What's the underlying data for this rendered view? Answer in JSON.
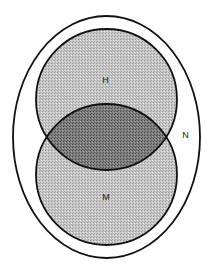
{
  "diagram": {
    "type": "venn",
    "sets": [
      {
        "id": "N",
        "label": "N",
        "shape": "ellipse",
        "role": "universe"
      },
      {
        "id": "H",
        "label": "H",
        "shape": "circle",
        "position": "top"
      },
      {
        "id": "M",
        "label": "M",
        "shape": "circle",
        "position": "bottom"
      }
    ],
    "intersection": {
      "sets": [
        "H",
        "M"
      ],
      "shading": "dark"
    },
    "colors": {
      "background": "#ffffff",
      "stroke": "#111111",
      "light_fill": "#c6c6c6",
      "light_dot": "#9a9a9a",
      "dark_fill": "#7e7e7e",
      "dark_dot": "#4a4a4a",
      "label": "#222222"
    }
  },
  "labels": {
    "n": "N",
    "h": "H",
    "m": "M"
  }
}
